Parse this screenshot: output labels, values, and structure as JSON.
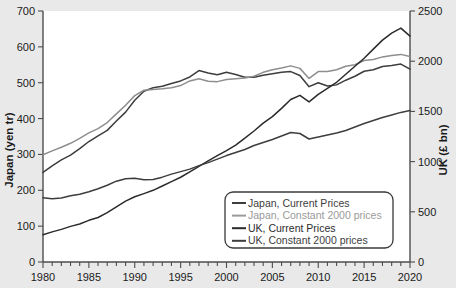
{
  "chart_data": {
    "type": "line",
    "title": "",
    "xlabel": "",
    "ylabel": "Japan (yen tr)",
    "y2label": "UK (£ bn)",
    "xlim": [
      1980,
      2020
    ],
    "ylim": [
      0,
      700
    ],
    "y2lim": [
      0,
      2500
    ],
    "grid": false,
    "legend_position": "bottom-right",
    "x_tick_labels": [
      "1980",
      "1985",
      "1990",
      "1995",
      "2000",
      "2005",
      "2010",
      "2015",
      "2020"
    ],
    "x_major_ticks": [
      1980,
      1985,
      1990,
      1995,
      2000,
      2005,
      2010,
      2015,
      2020
    ],
    "x_minor_tick_step": 1,
    "y_tick_labels": [
      "0",
      "100",
      "200",
      "300",
      "400",
      "500",
      "600",
      "700"
    ],
    "y_ticks": [
      0,
      100,
      200,
      300,
      400,
      500,
      600,
      700
    ],
    "y2_tick_labels": [
      "0",
      "500",
      "1000",
      "1500",
      "2000",
      "2500"
    ],
    "y2_ticks": [
      0,
      500,
      1000,
      1500,
      2000,
      2500
    ],
    "x": [
      1980,
      1981,
      1982,
      1983,
      1984,
      1985,
      1986,
      1987,
      1988,
      1989,
      1990,
      1991,
      1992,
      1993,
      1994,
      1995,
      1996,
      1997,
      1998,
      1999,
      2000,
      2001,
      2002,
      2003,
      2004,
      2005,
      2006,
      2007,
      2008,
      2009,
      2010,
      2011,
      2012,
      2013,
      2014,
      2015,
      2016,
      2017,
      2018,
      2019,
      2020
    ],
    "series": [
      {
        "name": "Japan, Current Prices",
        "axis": "left",
        "unit": "yen tr",
        "color": "#3d3d3d",
        "values": [
          250,
          268,
          285,
          298,
          316,
          336,
          352,
          367,
          393,
          418,
          451,
          476,
          486,
          490,
          498,
          505,
          516,
          534,
          527,
          522,
          529,
          523,
          515,
          515,
          521,
          525,
          529,
          531,
          520,
          489,
          500,
          491,
          494,
          507,
          518,
          532,
          536,
          545,
          548,
          552,
          538
        ]
      },
      {
        "name": "Japan, Constant 2000 prices",
        "axis": "left",
        "unit": "yen tr",
        "color": "#8e8e8e",
        "values": [
          299,
          310,
          320,
          331,
          345,
          360,
          372,
          389,
          413,
          437,
          464,
          479,
          481,
          483,
          486,
          492,
          505,
          511,
          504,
          503,
          509,
          511,
          513,
          518,
          529,
          536,
          541,
          547,
          540,
          512,
          531,
          531,
          536,
          546,
          550,
          562,
          565,
          572,
          576,
          579,
          573
        ]
      },
      {
        "name": "UK, Current Prices",
        "axis": "right",
        "unit": "£ bn",
        "color": "#2b2b2b",
        "values": [
          272,
          300,
          325,
          355,
          379,
          415,
          443,
          491,
          550,
          606,
          650,
          681,
          714,
          757,
          800,
          844,
          897,
          952,
          1008,
          1060,
          1110,
          1165,
          1234,
          1305,
          1383,
          1448,
          1530,
          1618,
          1660,
          1595,
          1670,
          1730,
          1790,
          1870,
          1950,
          2030,
          2120,
          2210,
          2280,
          2330,
          2250
        ]
      },
      {
        "name": "UK, Constant 2000 prices",
        "axis": "right",
        "unit": "£ bn",
        "color": "#3d3d3d",
        "values": [
          640,
          630,
          638,
          660,
          675,
          700,
          730,
          765,
          805,
          830,
          835,
          820,
          822,
          845,
          875,
          900,
          925,
          960,
          990,
          1025,
          1060,
          1090,
          1120,
          1160,
          1190,
          1220,
          1255,
          1290,
          1280,
          1225,
          1245,
          1265,
          1285,
          1310,
          1345,
          1380,
          1410,
          1440,
          1465,
          1490,
          1510
        ]
      }
    ],
    "legend_items": [
      {
        "label": "Japan, Current Prices",
        "color": "#3d3d3d"
      },
      {
        "label": "Japan, Constant 2000 prices",
        "color": "#9a9a9a"
      },
      {
        "label": "UK, Current Prices",
        "color": "#2b2b2b"
      },
      {
        "label": "UK, Constant 2000 prices",
        "color": "#3d3d3d"
      }
    ]
  }
}
